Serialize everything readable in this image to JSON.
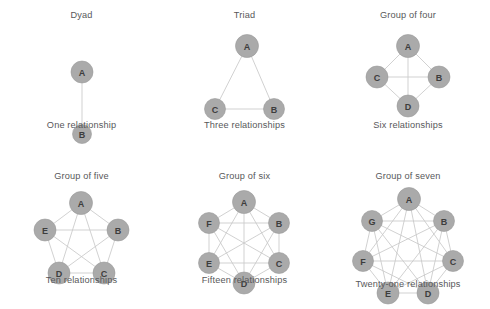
{
  "figure": {
    "background_color": "#ffffff",
    "node_fill_color": "#aaaaaa",
    "edge_color": "#c9c9c9",
    "text_color": "#58585a"
  },
  "panels": [
    {
      "id": "dyad",
      "title": "Dyad",
      "caption": "One relationship",
      "node_count": 2,
      "edge_count": 1,
      "layout": "vertical-pair",
      "radius": 0,
      "node_radius": 11,
      "center": {
        "x": 68,
        "y": 75
      },
      "nodes": [
        {
          "label": "A",
          "x": 68,
          "y": 44,
          "r": 11
        },
        {
          "label": "B",
          "x": 68,
          "y": 106,
          "r": 9.5
        }
      ],
      "edges": [
        [
          0,
          1
        ]
      ]
    },
    {
      "id": "triad",
      "title": "Triad",
      "caption": "Three relationships",
      "node_count": 3,
      "edge_count": 3,
      "layout": "triangle",
      "node_radius": 11,
      "nodes": [
        {
          "label": "A",
          "x": 65,
          "y": 18,
          "r": 11.5
        },
        {
          "label": "C",
          "x": 33,
          "y": 81,
          "r": 10.5
        },
        {
          "label": "B",
          "x": 92,
          "y": 81,
          "r": 10.5
        }
      ],
      "edges": [
        [
          0,
          1
        ],
        [
          0,
          2
        ],
        [
          1,
          2
        ]
      ]
    },
    {
      "id": "group-of-four",
      "title": "Group of four",
      "caption": "Six relationships",
      "node_count": 4,
      "edge_count": 6,
      "layout": "diamond",
      "node_radius": 11,
      "nodes": [
        {
          "label": "A",
          "x": 57,
          "y": 18,
          "r": 11.5
        },
        {
          "label": "C",
          "x": 26,
          "y": 49,
          "r": 11
        },
        {
          "label": "B",
          "x": 88,
          "y": 49,
          "r": 11
        },
        {
          "label": "D",
          "x": 57,
          "y": 78,
          "r": 11
        }
      ],
      "edges": [
        [
          0,
          1
        ],
        [
          0,
          2
        ],
        [
          0,
          3
        ],
        [
          1,
          2
        ],
        [
          1,
          3
        ],
        [
          2,
          3
        ]
      ]
    },
    {
      "id": "group-of-five",
      "title": "Group of five",
      "caption": "Ten relationships",
      "node_count": 5,
      "edge_count": 10,
      "layout": "pentagon",
      "node_radius": 11,
      "nodes": [
        {
          "label": "A",
          "x": 66,
          "y": 16,
          "r": 11.5
        },
        {
          "label": "B",
          "x": 103,
          "y": 43,
          "r": 11
        },
        {
          "label": "C",
          "x": 89,
          "y": 86,
          "r": 11
        },
        {
          "label": "D",
          "x": 44,
          "y": 86,
          "r": 11
        },
        {
          "label": "E",
          "x": 30,
          "y": 43,
          "r": 11
        }
      ],
      "edges": [
        [
          0,
          1
        ],
        [
          0,
          2
        ],
        [
          0,
          3
        ],
        [
          0,
          4
        ],
        [
          1,
          2
        ],
        [
          1,
          3
        ],
        [
          1,
          4
        ],
        [
          2,
          3
        ],
        [
          2,
          4
        ],
        [
          3,
          4
        ]
      ]
    },
    {
      "id": "group-of-six",
      "title": "Group of six",
      "caption": "Fifteen relationships",
      "node_count": 6,
      "edge_count": 15,
      "layout": "hexagon",
      "node_radius": 11,
      "nodes": [
        {
          "label": "A",
          "x": 66,
          "y": 17,
          "r": 11.5
        },
        {
          "label": "B",
          "x": 101,
          "y": 38,
          "r": 10.5
        },
        {
          "label": "C",
          "x": 101,
          "y": 78,
          "r": 10.5
        },
        {
          "label": "D",
          "x": 66,
          "y": 98,
          "r": 11
        },
        {
          "label": "E",
          "x": 31,
          "y": 78,
          "r": 10.5
        },
        {
          "label": "F",
          "x": 31,
          "y": 38,
          "r": 10.5
        }
      ],
      "edges": [
        [
          0,
          1
        ],
        [
          0,
          2
        ],
        [
          0,
          3
        ],
        [
          0,
          4
        ],
        [
          0,
          5
        ],
        [
          1,
          2
        ],
        [
          1,
          3
        ],
        [
          1,
          4
        ],
        [
          1,
          5
        ],
        [
          2,
          3
        ],
        [
          2,
          4
        ],
        [
          2,
          5
        ],
        [
          3,
          4
        ],
        [
          3,
          5
        ],
        [
          4,
          5
        ]
      ]
    },
    {
      "id": "group-of-seven",
      "title": "Group of seven",
      "caption": "Twenty-one relationships",
      "node_count": 7,
      "edge_count": 21,
      "layout": "heptagon",
      "node_radius": 11,
      "nodes": [
        {
          "label": "A",
          "x": 75,
          "y": 16,
          "r": 11.5
        },
        {
          "label": "B",
          "x": 110,
          "y": 38,
          "r": 10.5
        },
        {
          "label": "C",
          "x": 119,
          "y": 78,
          "r": 10.5
        },
        {
          "label": "D",
          "x": 94,
          "y": 110,
          "r": 11
        },
        {
          "label": "E",
          "x": 54,
          "y": 110,
          "r": 11
        },
        {
          "label": "F",
          "x": 29,
          "y": 78,
          "r": 10.5
        },
        {
          "label": "G",
          "x": 38,
          "y": 38,
          "r": 10.5
        }
      ],
      "edges": [
        [
          0,
          1
        ],
        [
          0,
          2
        ],
        [
          0,
          3
        ],
        [
          0,
          4
        ],
        [
          0,
          5
        ],
        [
          0,
          6
        ],
        [
          1,
          2
        ],
        [
          1,
          3
        ],
        [
          1,
          4
        ],
        [
          1,
          5
        ],
        [
          1,
          6
        ],
        [
          2,
          3
        ],
        [
          2,
          4
        ],
        [
          2,
          5
        ],
        [
          2,
          6
        ],
        [
          3,
          4
        ],
        [
          3,
          5
        ],
        [
          3,
          6
        ],
        [
          4,
          5
        ],
        [
          4,
          6
        ],
        [
          5,
          6
        ]
      ]
    }
  ]
}
